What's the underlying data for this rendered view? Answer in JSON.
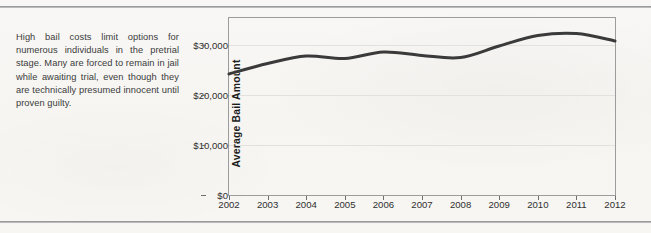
{
  "page": {
    "caption": "High bail costs limit options for numerous individuals in the pretrial stage. Many are forced to remain in jail while awaiting trial, even though they are technically presumed innocent until proven guilty.",
    "background_color": "#f7f6f3",
    "rule_color": "#9a9a9a"
  },
  "chart_data": {
    "type": "line",
    "title": "",
    "xlabel": "",
    "ylabel": "Average Bail Amount",
    "x": [
      2002,
      2003,
      2004,
      2005,
      2006,
      2007,
      2008,
      2009,
      2010,
      2011,
      2012
    ],
    "values": [
      24200,
      26300,
      27800,
      27300,
      28600,
      27900,
      27500,
      29800,
      31900,
      32300,
      30800
    ],
    "categories": [
      "2002",
      "2003",
      "2004",
      "2005",
      "2006",
      "2007",
      "2008",
      "2009",
      "2010",
      "2011",
      "2012"
    ],
    "xtick_labels": [
      "2002",
      "2003",
      "2004",
      "2005",
      "2006",
      "2007",
      "2008",
      "2009",
      "2010",
      "2011",
      "2012"
    ],
    "ytick_labels": [
      "$0",
      "$10,000",
      "$20,000",
      "$30,000"
    ],
    "ytick_values": [
      0,
      10000,
      20000,
      30000
    ],
    "ylim": [
      0,
      35400
    ],
    "xlim": [
      2002,
      2012
    ],
    "grid": true,
    "legend": false,
    "line_color": "#3a3a3a",
    "line_width": 3,
    "smoothing": "spline"
  }
}
